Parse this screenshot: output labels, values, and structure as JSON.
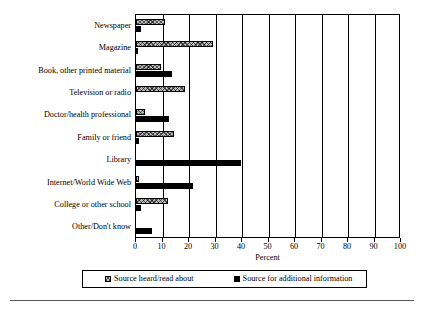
{
  "chart_data": {
    "type": "bar",
    "orientation": "horizontal",
    "title": "",
    "xlabel": "Percent",
    "ylabel": "",
    "xlim": [
      0,
      100
    ],
    "xticks": [
      0,
      10,
      20,
      30,
      40,
      50,
      60,
      70,
      80,
      90,
      100
    ],
    "grid": true,
    "legend_position": "bottom",
    "categories": [
      "Newspaper",
      "Magazine",
      "Book, other printed material",
      "Television or radio",
      "Doctor/health professional",
      "Family or friend",
      "Library",
      "Internet/World Wide Web",
      "College or other school",
      "Other/Don't know"
    ],
    "series": [
      {
        "name": "Source heard/read about",
        "pattern": "hatched",
        "color": "#c0c0c0",
        "values": [
          11,
          29,
          9.5,
          18.5,
          3.5,
          14.5,
          0,
          1,
          12,
          0
        ]
      },
      {
        "name": "Source for additional information",
        "pattern": "solid",
        "color": "#000000",
        "values": [
          2,
          0.5,
          13.5,
          0,
          12.5,
          1,
          39.5,
          21.5,
          2,
          6
        ]
      }
    ]
  },
  "axis": {
    "x_title": "Percent",
    "tick_labels": [
      "0",
      "10",
      "20",
      "30",
      "40",
      "50",
      "60",
      "70",
      "80",
      "90",
      "100"
    ]
  },
  "legend": {
    "entries": [
      {
        "label": "Source heard/read about",
        "swatch": "hatched-square-icon"
      },
      {
        "label": "Source for additional information",
        "swatch": "black-square-icon"
      }
    ]
  }
}
